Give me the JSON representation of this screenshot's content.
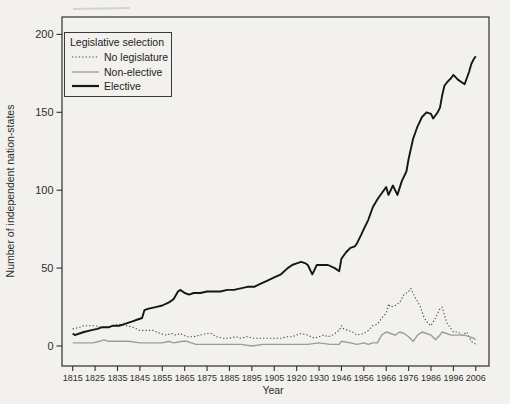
{
  "page": {
    "background": "#f2f1ed"
  },
  "chart_data": {
    "type": "line",
    "title": "",
    "legend_title": "Legislative selection",
    "legend_position": "top-left",
    "xlabel": "Year",
    "ylabel": "Number of independent nation-states",
    "grid": "off",
    "axis_color": "#2e2e2e",
    "y_ticks": [
      0,
      50,
      100,
      150,
      200
    ],
    "ylim": [
      -13,
      211
    ],
    "x_tick_years": [
      1815,
      1825,
      1835,
      1845,
      1855,
      1865,
      1875,
      1885,
      1895,
      1905,
      1920,
      1930,
      1946,
      1956,
      1966,
      1976,
      1986,
      1996,
      2006
    ],
    "x_year_range": [
      1815,
      2006
    ],
    "x_skipped_year_ranges": [
      [
        1915,
        1919
      ],
      [
        1940,
        1945
      ]
    ],
    "series": [
      {
        "name": "No legislature",
        "style": "dotted",
        "color": "#4a4a4a",
        "points": [
          [
            1815,
            11
          ],
          [
            1818,
            12
          ],
          [
            1820,
            13
          ],
          [
            1822,
            13
          ],
          [
            1825,
            13
          ],
          [
            1828,
            12
          ],
          [
            1830,
            12
          ],
          [
            1833,
            13
          ],
          [
            1836,
            14
          ],
          [
            1839,
            13
          ],
          [
            1842,
            12
          ],
          [
            1845,
            10
          ],
          [
            1848,
            10
          ],
          [
            1851,
            10
          ],
          [
            1854,
            8
          ],
          [
            1857,
            7
          ],
          [
            1859,
            8
          ],
          [
            1861,
            7
          ],
          [
            1863,
            8
          ],
          [
            1866,
            6
          ],
          [
            1869,
            6
          ],
          [
            1872,
            7
          ],
          [
            1875,
            8
          ],
          [
            1877,
            8
          ],
          [
            1879,
            6
          ],
          [
            1882,
            5
          ],
          [
            1885,
            5
          ],
          [
            1888,
            6
          ],
          [
            1890,
            5
          ],
          [
            1893,
            6
          ],
          [
            1896,
            5
          ],
          [
            1899,
            5
          ],
          [
            1902,
            5
          ],
          [
            1905,
            5
          ],
          [
            1908,
            5
          ],
          [
            1911,
            6
          ],
          [
            1913,
            6
          ],
          [
            1920,
            7
          ],
          [
            1922,
            8
          ],
          [
            1925,
            7
          ],
          [
            1928,
            5
          ],
          [
            1930,
            6
          ],
          [
            1932,
            7
          ],
          [
            1934,
            6
          ],
          [
            1936,
            7
          ],
          [
            1938,
            9
          ],
          [
            1939,
            10
          ],
          [
            1946,
            13
          ],
          [
            1947,
            11
          ],
          [
            1949,
            10
          ],
          [
            1951,
            9
          ],
          [
            1953,
            7
          ],
          [
            1956,
            8
          ],
          [
            1958,
            10
          ],
          [
            1960,
            13
          ],
          [
            1962,
            14
          ],
          [
            1964,
            18
          ],
          [
            1966,
            21
          ],
          [
            1967,
            27
          ],
          [
            1968,
            25
          ],
          [
            1970,
            26
          ],
          [
            1972,
            28
          ],
          [
            1974,
            33
          ],
          [
            1976,
            35
          ],
          [
            1977,
            37
          ],
          [
            1979,
            31
          ],
          [
            1981,
            26
          ],
          [
            1983,
            18
          ],
          [
            1985,
            14
          ],
          [
            1986,
            13
          ],
          [
            1988,
            18
          ],
          [
            1990,
            24
          ],
          [
            1991,
            25
          ],
          [
            1993,
            15
          ],
          [
            1995,
            11
          ],
          [
            1996,
            9
          ],
          [
            1998,
            9
          ],
          [
            2000,
            7
          ],
          [
            2002,
            9
          ],
          [
            2004,
            3
          ],
          [
            2006,
            1
          ]
        ]
      },
      {
        "name": "Non-elective",
        "style": "solid-thin",
        "color": "#9b9b9b",
        "points": [
          [
            1815,
            2
          ],
          [
            1820,
            2
          ],
          [
            1824,
            2
          ],
          [
            1827,
            3
          ],
          [
            1829,
            4
          ],
          [
            1831,
            3
          ],
          [
            1835,
            3
          ],
          [
            1840,
            3
          ],
          [
            1845,
            2
          ],
          [
            1850,
            2
          ],
          [
            1855,
            2
          ],
          [
            1858,
            3
          ],
          [
            1860,
            2
          ],
          [
            1864,
            3
          ],
          [
            1866,
            3
          ],
          [
            1870,
            1
          ],
          [
            1875,
            1
          ],
          [
            1880,
            1
          ],
          [
            1885,
            1
          ],
          [
            1890,
            1
          ],
          [
            1895,
            0
          ],
          [
            1900,
            1
          ],
          [
            1905,
            1
          ],
          [
            1910,
            1
          ],
          [
            1913,
            1
          ],
          [
            1920,
            1
          ],
          [
            1925,
            1
          ],
          [
            1930,
            2
          ],
          [
            1935,
            1
          ],
          [
            1939,
            1
          ],
          [
            1946,
            3
          ],
          [
            1950,
            2
          ],
          [
            1953,
            1
          ],
          [
            1956,
            2
          ],
          [
            1958,
            1
          ],
          [
            1960,
            2
          ],
          [
            1962,
            2
          ],
          [
            1964,
            7
          ],
          [
            1966,
            9
          ],
          [
            1968,
            8
          ],
          [
            1970,
            7
          ],
          [
            1972,
            9
          ],
          [
            1974,
            8
          ],
          [
            1976,
            6
          ],
          [
            1978,
            3
          ],
          [
            1980,
            7
          ],
          [
            1982,
            9
          ],
          [
            1984,
            8
          ],
          [
            1986,
            7
          ],
          [
            1988,
            4
          ],
          [
            1990,
            7
          ],
          [
            1991,
            9
          ],
          [
            1993,
            8
          ],
          [
            1995,
            7
          ],
          [
            1997,
            7
          ],
          [
            1999,
            7
          ],
          [
            2001,
            7
          ],
          [
            2003,
            6
          ],
          [
            2005,
            5
          ],
          [
            2006,
            4
          ]
        ]
      },
      {
        "name": "Elective",
        "style": "solid-thick",
        "color": "#161616",
        "points": [
          [
            1815,
            8
          ],
          [
            1816,
            7
          ],
          [
            1818,
            8
          ],
          [
            1820,
            9
          ],
          [
            1823,
            10
          ],
          [
            1826,
            11
          ],
          [
            1828,
            12
          ],
          [
            1831,
            12
          ],
          [
            1833,
            13
          ],
          [
            1836,
            13
          ],
          [
            1838,
            14
          ],
          [
            1840,
            15
          ],
          [
            1842,
            16
          ],
          [
            1844,
            17
          ],
          [
            1846,
            18
          ],
          [
            1847,
            23
          ],
          [
            1849,
            24
          ],
          [
            1852,
            25
          ],
          [
            1855,
            26
          ],
          [
            1858,
            28
          ],
          [
            1860,
            30
          ],
          [
            1862,
            35
          ],
          [
            1863,
            36
          ],
          [
            1865,
            34
          ],
          [
            1867,
            33
          ],
          [
            1869,
            34
          ],
          [
            1872,
            34
          ],
          [
            1875,
            35
          ],
          [
            1878,
            35
          ],
          [
            1881,
            35
          ],
          [
            1884,
            36
          ],
          [
            1887,
            36
          ],
          [
            1890,
            37
          ],
          [
            1893,
            38
          ],
          [
            1896,
            38
          ],
          [
            1899,
            40
          ],
          [
            1902,
            42
          ],
          [
            1905,
            44
          ],
          [
            1908,
            46
          ],
          [
            1911,
            50
          ],
          [
            1913,
            52
          ],
          [
            1920,
            53
          ],
          [
            1922,
            54
          ],
          [
            1924,
            53
          ],
          [
            1925,
            52
          ],
          [
            1927,
            46
          ],
          [
            1929,
            52
          ],
          [
            1931,
            52
          ],
          [
            1934,
            52
          ],
          [
            1937,
            50
          ],
          [
            1939,
            48
          ],
          [
            1946,
            56
          ],
          [
            1948,
            60
          ],
          [
            1950,
            63
          ],
          [
            1952,
            64
          ],
          [
            1953,
            66
          ],
          [
            1955,
            72
          ],
          [
            1956,
            75
          ],
          [
            1958,
            81
          ],
          [
            1960,
            89
          ],
          [
            1962,
            94
          ],
          [
            1964,
            98
          ],
          [
            1966,
            102
          ],
          [
            1967,
            97
          ],
          [
            1969,
            103
          ],
          [
            1971,
            97
          ],
          [
            1973,
            106
          ],
          [
            1975,
            112
          ],
          [
            1976,
            120
          ],
          [
            1978,
            133
          ],
          [
            1980,
            141
          ],
          [
            1982,
            147
          ],
          [
            1984,
            150
          ],
          [
            1986,
            149
          ],
          [
            1987,
            146
          ],
          [
            1989,
            150
          ],
          [
            1990,
            153
          ],
          [
            1991,
            161
          ],
          [
            1992,
            167
          ],
          [
            1993,
            169
          ],
          [
            1995,
            172
          ],
          [
            1996,
            174
          ],
          [
            1998,
            171
          ],
          [
            2000,
            169
          ],
          [
            2001,
            168
          ],
          [
            2003,
            176
          ],
          [
            2004,
            181
          ],
          [
            2005,
            184
          ],
          [
            2006,
            186
          ]
        ]
      }
    ]
  }
}
